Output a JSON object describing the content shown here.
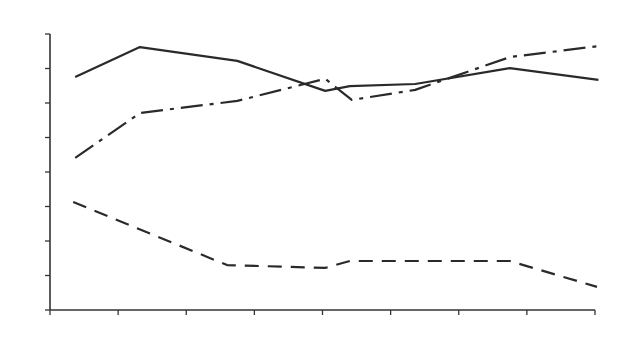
{
  "chart_data": {
    "type": "line",
    "title": "",
    "xlabel": "",
    "ylabel": "",
    "xlim": [
      0,
      8
    ],
    "ylim": [
      0,
      8
    ],
    "x_ticks": [
      0,
      1,
      2,
      3,
      4,
      5,
      6,
      7,
      8
    ],
    "y_ticks": [
      0,
      1,
      2,
      3,
      4,
      5,
      6,
      7,
      8
    ],
    "tick_labels_shown": false,
    "grid": false,
    "legend": null,
    "series": [
      {
        "name": "solid",
        "style": "solid",
        "x": [
          0.37,
          1.32,
          2.75,
          4.04,
          4.4,
          5.36,
          6.75,
          8.05
        ],
        "values": [
          6.75,
          7.62,
          7.22,
          6.35,
          6.49,
          6.55,
          7.01,
          6.67
        ]
      },
      {
        "name": "dash-dot",
        "style": "dashdot",
        "x": [
          0.37,
          1.32,
          2.75,
          4.04,
          4.43,
          5.36,
          6.75,
          8.05
        ],
        "values": [
          4.41,
          5.71,
          6.06,
          6.7,
          6.09,
          6.38,
          7.33,
          7.65
        ]
      },
      {
        "name": "dashed",
        "style": "dashed",
        "x": [
          0.34,
          2.6,
          4.04,
          4.4,
          6.75,
          8.03
        ],
        "values": [
          3.13,
          1.3,
          1.22,
          1.42,
          1.42,
          0.67
        ]
      }
    ]
  },
  "colors": {
    "line": "#2a2a2a",
    "axis": "#333333",
    "background": "#ffffff"
  }
}
